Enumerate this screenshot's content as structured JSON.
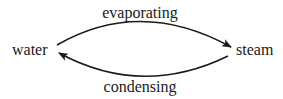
{
  "diagram": {
    "type": "cycle",
    "nodes": [
      {
        "id": "water",
        "label": "water"
      },
      {
        "id": "steam",
        "label": "steam"
      }
    ],
    "edges": [
      {
        "from": "water",
        "to": "steam",
        "label": "evaporating",
        "position": "top"
      },
      {
        "from": "steam",
        "to": "water",
        "label": "condensing",
        "position": "bottom"
      }
    ],
    "colors": {
      "stroke": "#1a1a1a",
      "text": "#1a1a1a",
      "background": "#ffffff"
    }
  }
}
